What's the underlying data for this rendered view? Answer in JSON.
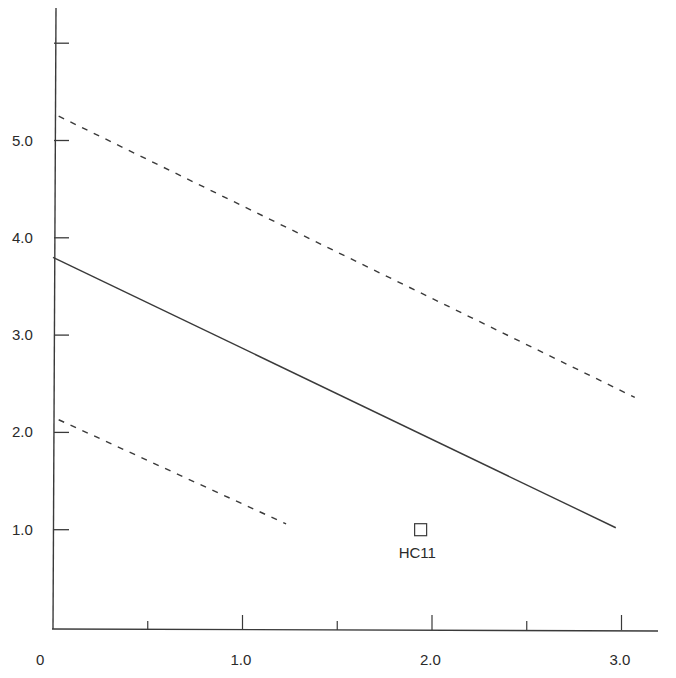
{
  "chart_data": {
    "type": "line",
    "title": "",
    "xlabel": "",
    "ylabel": "",
    "xlim": [
      0,
      3.2
    ],
    "ylim": [
      0,
      6.0
    ],
    "grid": false,
    "legend": null,
    "x_ticks": [
      {
        "value": 0,
        "label": "0",
        "major": true
      },
      {
        "value": 0.5,
        "label": "",
        "major": false
      },
      {
        "value": 1.0,
        "label": "1.0",
        "major": true
      },
      {
        "value": 1.5,
        "label": "",
        "major": false
      },
      {
        "value": 2.0,
        "label": "2.0",
        "major": true
      },
      {
        "value": 2.5,
        "label": "",
        "major": false
      },
      {
        "value": 3.0,
        "label": "3.0",
        "major": true
      }
    ],
    "y_ticks": [
      {
        "value": 1.0,
        "label": "1.0"
      },
      {
        "value": 2.0,
        "label": "2.0"
      },
      {
        "value": 3.0,
        "label": "3.0"
      },
      {
        "value": 4.0,
        "label": "4.0"
      },
      {
        "value": 5.0,
        "label": "5.0"
      },
      {
        "value": 6.0,
        "label": ""
      }
    ],
    "series": [
      {
        "name": "regression line",
        "style": "solid",
        "x": [
          0.0,
          2.97
        ],
        "y": [
          3.8,
          1.02
        ]
      },
      {
        "name": "upper bound",
        "style": "dashed",
        "x": [
          0.03,
          3.07
        ],
        "y": [
          5.25,
          2.36
        ]
      },
      {
        "name": "lower bound",
        "style": "dashed",
        "x": [
          0.03,
          1.23
        ],
        "y": [
          2.13,
          1.06
        ]
      }
    ],
    "points": [
      {
        "label": "HC11",
        "x": 1.94,
        "y": 1.0,
        "marker": "open-square"
      }
    ]
  },
  "colors": {
    "axis": "#3a3a3a",
    "line": "#3a3a3a",
    "text": "#2a2a2a",
    "background": "#ffffff"
  }
}
